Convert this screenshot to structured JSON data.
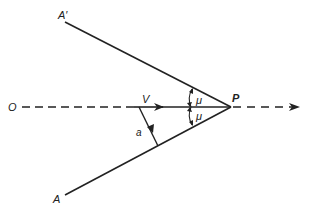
{
  "labels": {
    "a_prime": "A′",
    "a": "A",
    "o": "O",
    "v": "V",
    "p": "P",
    "a_vec": "a",
    "mu_upper": "μ",
    "mu_lower": "μ"
  },
  "colors": {
    "ink": "#222222",
    "background": "#ffffff"
  }
}
